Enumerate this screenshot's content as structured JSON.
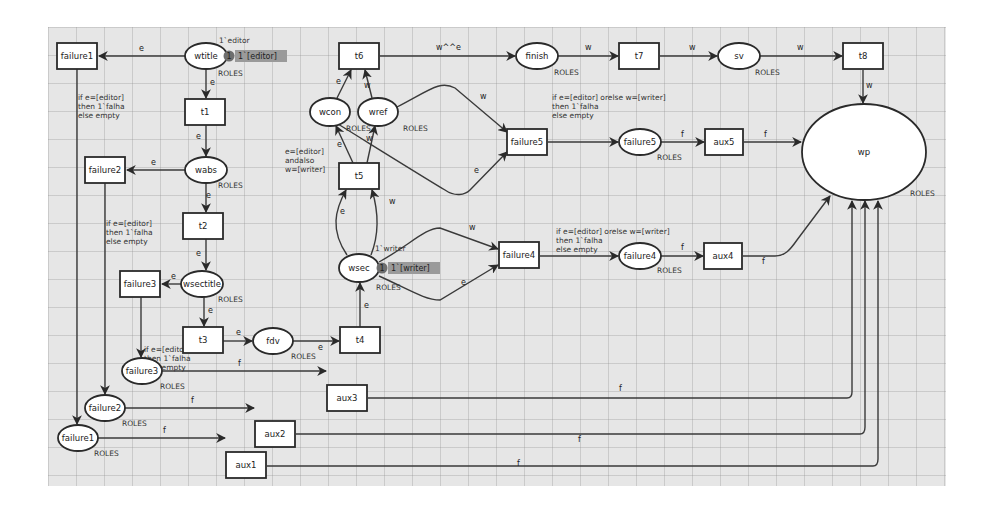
{
  "diagram": {
    "type": "colored-petri-net",
    "places": [
      {
        "id": "wtitle",
        "label": "wtitle",
        "cx": 206,
        "cy": 56,
        "rx": 21,
        "ry": 13,
        "type_label": "ROLES",
        "tx": 218,
        "ty": 76,
        "initial_marking": "1`editor",
        "mx": 219,
        "my": 43,
        "token_count": "1",
        "token_value": "1`[editor]",
        "tokx": 229,
        "toky": 56
      },
      {
        "id": "wabs",
        "label": "wabs",
        "cx": 206,
        "cy": 170,
        "rx": 21,
        "ry": 13,
        "type_label": "ROLES",
        "tx": 218,
        "ty": 188
      },
      {
        "id": "wsectitle",
        "label": "wsectitle",
        "cx": 202,
        "cy": 284,
        "rx": 21,
        "ry": 13,
        "type_label": "ROLES",
        "tx": 218,
        "ty": 302
      },
      {
        "id": "fdv",
        "label": "fdv",
        "cx": 273,
        "cy": 341,
        "rx": 20,
        "ry": 13,
        "type_label": "ROLES",
        "tx": 291,
        "ty": 359
      },
      {
        "id": "wsec",
        "label": "wsec",
        "cx": 359,
        "cy": 268,
        "rx": 20,
        "ry": 14,
        "type_label": "ROLES",
        "tx": 376,
        "ty": 290,
        "initial_marking": "1`writer",
        "mx": 375,
        "my": 251,
        "token_count": "1",
        "token_value": "1`[writer]",
        "tokx": 382,
        "toky": 268
      },
      {
        "id": "wcon",
        "label": "wcon",
        "cx": 330,
        "cy": 112,
        "rx": 20,
        "ry": 14,
        "type_label": "ROLES",
        "tx": 346,
        "ty": 131
      },
      {
        "id": "wref",
        "label": "wref",
        "cx": 378,
        "cy": 112,
        "rx": 20,
        "ry": 14,
        "type_label": "ROLES",
        "tx": 403,
        "ty": 131
      },
      {
        "id": "finish",
        "label": "finish",
        "cx": 537,
        "cy": 56,
        "rx": 21,
        "ry": 13,
        "type_label": "ROLES",
        "tx": 554,
        "ty": 75
      },
      {
        "id": "sv",
        "label": "sv",
        "cx": 739,
        "cy": 56,
        "rx": 21,
        "ry": 13,
        "type_label": "ROLES",
        "tx": 755,
        "ty": 75
      },
      {
        "id": "failure5",
        "label": "failure5",
        "cx": 640,
        "cy": 142,
        "rx": 21,
        "ry": 13,
        "type_label": "ROLES",
        "tx": 657,
        "ty": 160
      },
      {
        "id": "failure4",
        "label": "failure4",
        "cx": 640,
        "cy": 256,
        "rx": 21,
        "ry": 13,
        "type_label": "ROLES",
        "tx": 657,
        "ty": 273
      },
      {
        "id": "wp",
        "label": "wp",
        "cx": 864,
        "cy": 152,
        "rx": 62,
        "ry": 48,
        "type_label": "ROLES",
        "tx": 910,
        "ty": 196
      },
      {
        "id": "failure3p",
        "label": "failure3",
        "cx": 142,
        "cy": 371,
        "rx": 20,
        "ry": 13,
        "type_label": "ROLES",
        "tx": 160,
        "ty": 389
      },
      {
        "id": "failure2p",
        "label": "failure2",
        "cx": 105,
        "cy": 408,
        "rx": 20,
        "ry": 13,
        "type_label": "ROLES",
        "tx": 122,
        "ty": 426
      },
      {
        "id": "failure1p",
        "label": "failure1",
        "cx": 78,
        "cy": 438,
        "rx": 20,
        "ry": 13,
        "type_label": "ROLES",
        "tx": 94,
        "ty": 456
      }
    ],
    "transitions": [
      {
        "id": "failure1t",
        "label": "failure1",
        "x": 57,
        "y": 43,
        "w": 40,
        "h": 26
      },
      {
        "id": "t1",
        "label": "t1",
        "x": 185,
        "y": 99,
        "w": 40,
        "h": 26
      },
      {
        "id": "failure2t",
        "label": "failure2",
        "x": 85,
        "y": 157,
        "w": 40,
        "h": 26
      },
      {
        "id": "t2",
        "label": "t2",
        "x": 183,
        "y": 213,
        "w": 40,
        "h": 26
      },
      {
        "id": "failure3t",
        "label": "failure3",
        "x": 120,
        "y": 271,
        "w": 40,
        "h": 26
      },
      {
        "id": "t3",
        "label": "t3",
        "x": 183,
        "y": 327,
        "w": 40,
        "h": 26
      },
      {
        "id": "t4",
        "label": "t4",
        "x": 340,
        "y": 327,
        "w": 40,
        "h": 26
      },
      {
        "id": "t5",
        "label": "t5",
        "x": 339,
        "y": 163,
        "w": 40,
        "h": 26
      },
      {
        "id": "t6",
        "label": "t6",
        "x": 339,
        "y": 43,
        "w": 40,
        "h": 26
      },
      {
        "id": "failure5t",
        "label": "failure5",
        "x": 507,
        "y": 129,
        "w": 40,
        "h": 26
      },
      {
        "id": "failure4t",
        "label": "failure4",
        "x": 499,
        "y": 242,
        "w": 40,
        "h": 26
      },
      {
        "id": "t7",
        "label": "t7",
        "x": 619,
        "y": 43,
        "w": 40,
        "h": 26
      },
      {
        "id": "t8",
        "label": "t8",
        "x": 843,
        "y": 43,
        "w": 40,
        "h": 26
      },
      {
        "id": "aux5",
        "label": "aux5",
        "x": 705,
        "y": 129,
        "w": 38,
        "h": 26
      },
      {
        "id": "aux4",
        "label": "aux4",
        "x": 704,
        "y": 243,
        "w": 38,
        "h": 26
      },
      {
        "id": "aux3",
        "label": "aux3",
        "x": 327,
        "y": 385,
        "w": 40,
        "h": 26
      },
      {
        "id": "aux2",
        "label": "aux2",
        "x": 255,
        "y": 421,
        "w": 40,
        "h": 26
      },
      {
        "id": "aux1",
        "label": "aux1",
        "x": 226,
        "y": 452,
        "w": 40,
        "h": 26
      }
    ],
    "arcs": [
      {
        "d": "M185,56 L99,56",
        "label": "e",
        "lx": 139,
        "ly": 51
      },
      {
        "d": "M206,69 L206,98",
        "label": "e",
        "lx": 210,
        "ly": 85
      },
      {
        "d": "M206,125 L206,156",
        "label": "e",
        "lx": 196,
        "ly": 139
      },
      {
        "d": "M185,170 L127,170",
        "label": "e",
        "lx": 151,
        "ly": 165
      },
      {
        "d": "M206,183 L206,212",
        "label": "e",
        "lx": 206,
        "ly": 198
      },
      {
        "d": "M206,239 L206,270",
        "label": "e",
        "lx": 196,
        "ly": 256
      },
      {
        "d": "M181,284 L162,284",
        "label": "e",
        "lx": 171,
        "ly": 279
      },
      {
        "d": "M204,297 L204,326",
        "label": "e",
        "lx": 208,
        "ly": 313
      },
      {
        "d": "M223,341 L252,341",
        "label": "e",
        "lx": 236,
        "ly": 335
      },
      {
        "d": "M293,341 L339,341",
        "label": "e",
        "lx": 318,
        "ly": 350
      },
      {
        "d": "M360,327 L360,283",
        "label": "e",
        "lx": 364,
        "ly": 308
      },
      {
        "d": "M347,255 C330,230 335,210 346,190",
        "label": "e",
        "lx": 340,
        "ly": 214
      },
      {
        "d": "M371,255 C380,232 378,210 372,190",
        "label": "w",
        "lx": 389,
        "ly": 204
      },
      {
        "d": "M353,163 L336,126",
        "label": "e",
        "lx": 337,
        "ly": 147
      },
      {
        "d": "M367,163 L375,126",
        "label": "w",
        "lx": 366,
        "ly": 141
      },
      {
        "d": "M337,98 L351,70",
        "label": "e",
        "lx": 336,
        "ly": 84
      },
      {
        "d": "M372,98 L365,70",
        "label": "w",
        "lx": 364,
        "ly": 88
      },
      {
        "d": "M380,56 L515,56",
        "label": "w^^e",
        "lx": 436,
        "ly": 50
      },
      {
        "d": "M558,56 L618,56",
        "label": "w",
        "lx": 585,
        "ly": 50
      },
      {
        "d": "M660,56 L717,56",
        "label": "w",
        "lx": 689,
        "ly": 50
      },
      {
        "d": "M760,56 L842,56",
        "label": "w",
        "lx": 797,
        "ly": 50
      },
      {
        "d": "M863,70 L863,103",
        "label": "w",
        "lx": 866,
        "ly": 88
      },
      {
        "d": "M397,107 C430,90 440,80 455,88 L507,132",
        "label": "w",
        "lx": 480,
        "ly": 99
      },
      {
        "d": "M338,124 C380,150 420,175 445,190 C455,197 465,195 470,190 L507,152",
        "label": "e",
        "lx": 474,
        "ly": 173
      },
      {
        "d": "M379,262 C410,245 425,228 440,228 L498,249",
        "label": "w",
        "lx": 469,
        "ly": 230
      },
      {
        "d": "M379,276 C410,290 425,300 440,300 L498,265",
        "label": "e",
        "lx": 461,
        "ly": 285
      },
      {
        "d": "M548,142 L618,142",
        "label": "",
        "lx": 0,
        "ly": 0
      },
      {
        "d": "M540,256 L618,256",
        "label": "",
        "lx": 0,
        "ly": 0
      },
      {
        "d": "M661,142 L704,142",
        "label": "f",
        "lx": 681,
        "ly": 137
      },
      {
        "d": "M661,256 L703,256",
        "label": "f",
        "lx": 681,
        "ly": 250
      },
      {
        "d": "M744,142 L801,142",
        "label": "f",
        "lx": 764,
        "ly": 137
      },
      {
        "d": "M743,256 L775,256 C785,256 790,250 797,240 L830,196",
        "label": "f",
        "lx": 762,
        "ly": 264
      },
      {
        "d": "M77,69 L77,424",
        "label": "",
        "lx": 0,
        "ly": 0
      },
      {
        "d": "M105,183 L105,394",
        "label": "",
        "lx": 0,
        "ly": 0
      },
      {
        "d": "M141,297 L141,357",
        "label": "",
        "lx": 0,
        "ly": 0
      },
      {
        "d": "M162,371 L326,371",
        "label": "f",
        "lx": 238,
        "ly": 366
      },
      {
        "d": "M125,408 L254,408",
        "label": "f",
        "lx": 191,
        "ly": 403
      },
      {
        "d": "M98,438 L225,438",
        "label": "f",
        "lx": 163,
        "ly": 433
      },
      {
        "d": "M368,398 L847,398 C852,398 852,394 852,392 L852,201",
        "label": "f",
        "lx": 619,
        "ly": 391
      },
      {
        "d": "M296,434 L860,434 C864,434 865,430 865,427 L865,201",
        "label": "f",
        "lx": 578,
        "ly": 442
      },
      {
        "d": "M267,466 L873,466 C877,466 878,462 878,459 L878,201",
        "label": "f",
        "lx": 517,
        "ly": 466
      }
    ],
    "guards": [
      {
        "lines": [
          "if e=[editor]",
          "then 1`falha",
          "else empty"
        ],
        "x": 78,
        "y": 100
      },
      {
        "lines": [
          "if e=[editor]",
          "then 1`falha",
          "else empty"
        ],
        "x": 106,
        "y": 226
      },
      {
        "lines": [
          "if e=[editor]",
          "then 1`falha",
          "else empty"
        ],
        "x": 144,
        "y": 352
      },
      {
        "lines": [
          "e=[editor]",
          "andalso",
          "w=[writer]"
        ],
        "x": 285,
        "y": 154
      },
      {
        "lines": [
          "if e=[editor] orelse w=[writer]",
          "then 1`falha",
          "else empty"
        ],
        "x": 552,
        "y": 100
      },
      {
        "lines": [
          "if e=[editor] orelse w=[writer]",
          "then 1`falha",
          "else empty"
        ],
        "x": 556,
        "y": 234
      }
    ]
  }
}
